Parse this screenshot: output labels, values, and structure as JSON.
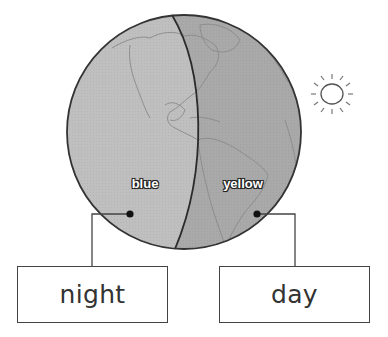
{
  "diagram": {
    "globe": {
      "night_side_label": "blue",
      "day_side_label": "yellow",
      "night_color": "#bdbdbd",
      "day_color": "#a8a8a8",
      "outline_color": "#333333"
    },
    "boxes": {
      "night": "night",
      "day": "day"
    },
    "sun": {
      "icon": "sun-icon"
    }
  }
}
